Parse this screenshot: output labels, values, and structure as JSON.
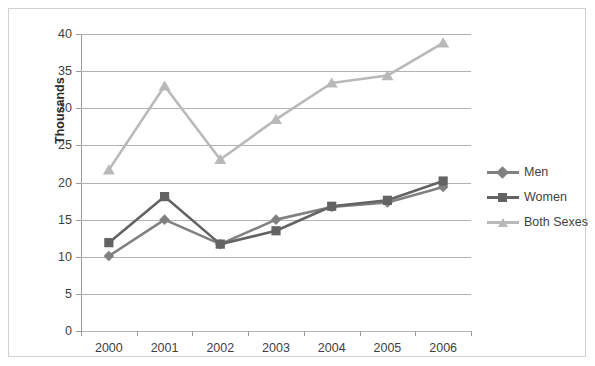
{
  "chart_data": {
    "type": "line",
    "title": "",
    "xlabel": "",
    "ylabel": "Thousands",
    "categories": [
      "2000",
      "2001",
      "2002",
      "2003",
      "2004",
      "2005",
      "2006"
    ],
    "ylim": [
      0,
      40
    ],
    "yticks": [
      "0",
      "5",
      "10",
      "15",
      "20",
      "25",
      "30",
      "35",
      "40"
    ],
    "grid": "horizontal",
    "legend_position": "right",
    "series": [
      {
        "name": "Men",
        "marker": "diamond",
        "color": "#808080",
        "values": [
          10.1,
          15.0,
          11.7,
          15.0,
          16.7,
          17.3,
          19.4
        ]
      },
      {
        "name": "Women",
        "marker": "square",
        "color": "#636363",
        "values": [
          11.9,
          18.1,
          11.7,
          13.5,
          16.8,
          17.6,
          20.2
        ]
      },
      {
        "name": "Both Sexes",
        "marker": "triangle",
        "color": "#b9b9b9",
        "values": [
          21.7,
          33.0,
          23.1,
          28.5,
          33.4,
          34.4,
          38.8
        ]
      }
    ]
  },
  "axis": {
    "y_title": "Thousands"
  }
}
